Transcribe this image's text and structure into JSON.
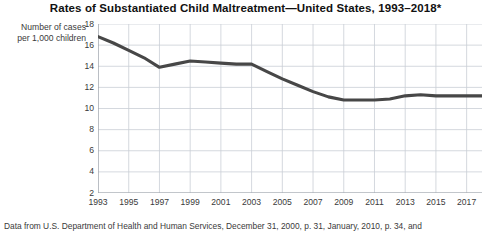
{
  "chart_data": {
    "type": "line",
    "title": "Rates of Substantiated Child Maltreatment—United States, 1993–2018*",
    "xlabel": "",
    "ylabel": "Number of cases per 1,000 children",
    "ylabel_line1": "Number of cases",
    "ylabel_line2": "per 1,000 children",
    "grid": true,
    "legend": "none",
    "xlim": [
      1993,
      2018
    ],
    "ylim": [
      2,
      18
    ],
    "yticks": [
      18,
      16,
      14,
      12,
      10,
      8,
      6,
      4,
      2
    ],
    "xticks": [
      1993,
      1995,
      1997,
      1999,
      2001,
      2003,
      2005,
      2007,
      2009,
      2011,
      2013,
      2015,
      2017
    ],
    "x": [
      1993,
      1994,
      1995,
      1996,
      1997,
      1998,
      1999,
      2000,
      2001,
      2002,
      2003,
      2004,
      2005,
      2006,
      2007,
      2008,
      2009,
      2010,
      2011,
      2012,
      2013,
      2014,
      2015,
      2016,
      2017,
      2018
    ],
    "series": [
      {
        "name": "Substantiated child maltreatment rate",
        "color": "#474747",
        "values": [
          16.8,
          16.2,
          15.5,
          14.8,
          13.9,
          14.2,
          14.5,
          14.4,
          14.3,
          14.2,
          14.2,
          13.5,
          12.8,
          12.2,
          11.6,
          11.1,
          10.8,
          10.8,
          10.8,
          10.9,
          11.2,
          11.3,
          11.2,
          11.2,
          11.2,
          11.2
        ]
      }
    ],
    "footnote": "Data from U.S. Department of Health and Human Services, December 31, 2000, p. 31, January, 2010, p. 34, and",
    "colors": {
      "line": "#474747",
      "grid": "#c9ced6",
      "axis": "#9aa0a8",
      "text": "#3a3a3a",
      "title": "#111111",
      "background": "#ffffff"
    }
  }
}
